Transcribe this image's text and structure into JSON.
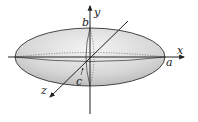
{
  "figure": {
    "axes": {
      "x": {
        "label": "x"
      },
      "y": {
        "label": "y"
      },
      "z": {
        "label": "z"
      }
    },
    "semi_axes": {
      "a": {
        "label": "a"
      },
      "b": {
        "label": "b"
      },
      "c": {
        "label": "c"
      }
    },
    "colors": {
      "fill_light": "#f2f2f2",
      "fill_dark": "#c4c4c4",
      "stroke": "#222222"
    }
  }
}
